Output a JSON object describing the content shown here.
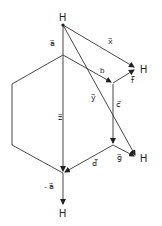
{
  "diagram": {
    "type": "vector-diagram",
    "atoms": [
      {
        "id": "H_top",
        "label": "H"
      },
      {
        "id": "H_right_upper",
        "label": "H"
      },
      {
        "id": "H_right_lower",
        "label": "H"
      },
      {
        "id": "H_bottom",
        "label": "H"
      }
    ],
    "vectors": [
      {
        "id": "a",
        "label": "a",
        "display": "a⃗"
      },
      {
        "id": "b",
        "label": "b",
        "display": "b"
      },
      {
        "id": "c",
        "label": "c",
        "display": "c⃗"
      },
      {
        "id": "d",
        "label": "d",
        "display": "d⃗"
      },
      {
        "id": "f",
        "label": "f",
        "display": "f⃗"
      },
      {
        "id": "g",
        "label": "g",
        "display": "g⃗"
      },
      {
        "id": "x",
        "label": "x",
        "display": "x⃗"
      },
      {
        "id": "y",
        "label": "y",
        "display": "y⃗"
      },
      {
        "id": "z",
        "label": "z",
        "display": "z⃗"
      },
      {
        "id": "neg_a",
        "label": "-a",
        "display": "- a⃗"
      }
    ],
    "colors": {
      "line": "#333333",
      "background": "#ffffff"
    }
  }
}
